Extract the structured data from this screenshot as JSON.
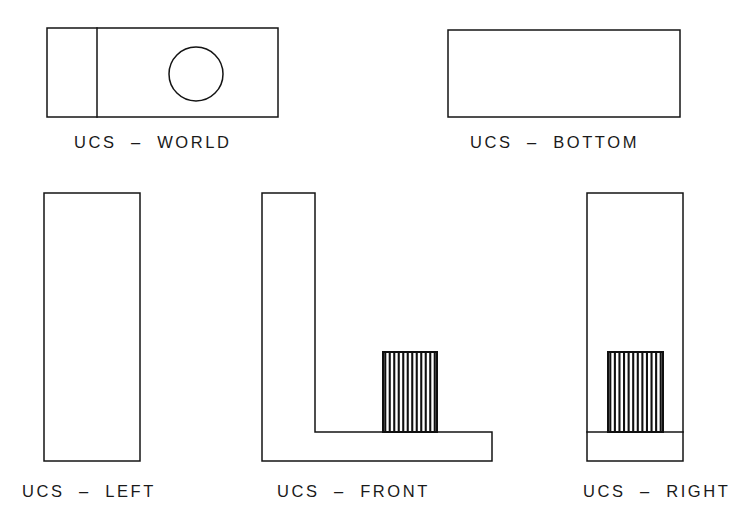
{
  "sheet": {
    "background_color": "#ffffff",
    "line_color": "#141414",
    "hatch_color": "#101010",
    "width": 730,
    "height": 525
  },
  "views": {
    "world": {
      "label": "UCS  –  WORLD",
      "label_x": 74,
      "label_y": 148,
      "outline_x": 47,
      "outline_y": 28,
      "outline_w": 231,
      "outline_h": 89,
      "divider_x": 97,
      "circle_cx": 196,
      "circle_cy": 74,
      "circle_r": 27
    },
    "bottom": {
      "label": "UCS  –  BOTTOM",
      "label_x": 470,
      "label_y": 148,
      "outline_x": 448,
      "outline_y": 30,
      "outline_w": 232,
      "outline_h": 87
    },
    "left": {
      "label": "UCS  –  LEFT",
      "label_x": 22,
      "label_y": 497,
      "outline_x": 44,
      "outline_y": 193,
      "outline_w": 96,
      "outline_h": 268
    },
    "front": {
      "label": "UCS  –  FRONT",
      "label_x": 277,
      "label_y": 497,
      "profile_points": "262,193 315,193 315,432 492,432 492,461 262,461",
      "boss_x": 383,
      "boss_y": 352,
      "boss_w": 54,
      "boss_h": 80,
      "boss_hatch_count": 12
    },
    "right": {
      "label": "UCS  –  RIGHT",
      "label_x": 583,
      "label_y": 497,
      "outline_x": 587,
      "outline_y": 193,
      "outline_w": 96,
      "outline_h": 268,
      "floor_y": 432,
      "boss_x": 608,
      "boss_y": 352,
      "boss_w": 55,
      "boss_h": 80,
      "boss_hatch_count": 12
    }
  }
}
